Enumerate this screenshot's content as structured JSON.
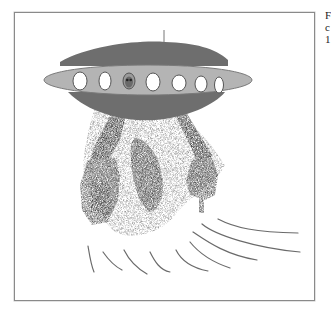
{
  "figure": {
    "colors": {
      "frame_border": "#8a8a8a",
      "dome_dark": "#6e6e6e",
      "band_light": "#b4b4b4",
      "band_outline": "#7a7a7a",
      "window_fill": "#ffffff",
      "smoke_dark": "#4a4a4a",
      "smoke_light": "#a8a8a8",
      "motion_lines": "#6a6a6a"
    },
    "windows_count": 7,
    "alien_window_index": 2
  },
  "side_caption": {
    "lines": [
      "F",
      "c",
      "1"
    ]
  }
}
